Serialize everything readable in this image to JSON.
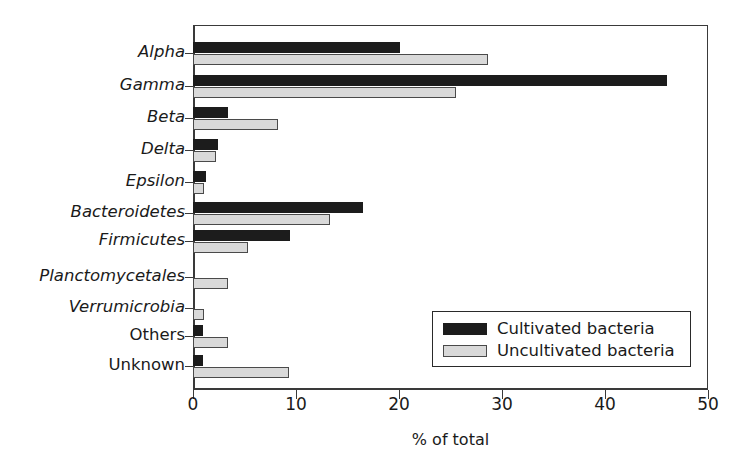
{
  "chart_data": {
    "type": "bar",
    "orientation": "horizontal",
    "title": "",
    "xlabel": "% of total",
    "ylabel": "",
    "xlim": [
      0,
      50
    ],
    "xticks": [
      "0",
      "10",
      "20",
      "30",
      "40",
      "50"
    ],
    "grid": false,
    "legend_position": "inside-bottom-right",
    "categories": [
      "Alpha",
      "Gamma",
      "Beta",
      "Delta",
      "Epsilon",
      "Bacteroidetes",
      "Firmicutes",
      "Planctomycetales",
      "Verrumicrobia",
      "Others",
      "Unknown"
    ],
    "category_styles": [
      "italic",
      "italic",
      "italic",
      "italic",
      "italic",
      "italic",
      "italic",
      "italic",
      "italic",
      "normal",
      "normal"
    ],
    "series": [
      {
        "name": "Cultivated bacteria",
        "color": "#1c1c1c",
        "values": [
          20.1,
          46.0,
          3.4,
          2.4,
          1.3,
          16.5,
          9.4,
          0,
          0,
          1.0,
          1.0
        ]
      },
      {
        "name": "Uncultivated bacteria",
        "color": "#d9d9d9",
        "values": [
          28.6,
          25.5,
          8.3,
          2.2,
          1.1,
          13.3,
          5.3,
          3.4,
          1.1,
          3.4,
          9.3
        ]
      }
    ]
  },
  "legend": {
    "entries": [
      {
        "label": "Cultivated bacteria",
        "swatch": "dark"
      },
      {
        "label": "Uncultivated bacteria",
        "swatch": "light"
      }
    ]
  },
  "colors": {
    "cultivated": "#1c1c1c",
    "uncultivated": "#d9d9d9",
    "axis": "#3a3a3a",
    "background": "#ffffff"
  }
}
